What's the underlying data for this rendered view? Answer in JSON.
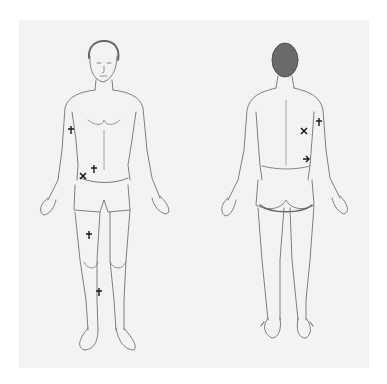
{
  "diagram": {
    "title": "",
    "type": "body-chart",
    "paper_color": "#f3f3f3",
    "line_color": "#7a7a7a",
    "mark_color": "#1a1a1a",
    "figures": [
      {
        "id": "front",
        "label": "Front view",
        "marks": [
          {
            "symbol": "plus",
            "location": "right upper arm",
            "x": 71,
            "y": 130
          },
          {
            "symbol": "plus",
            "location": "lower abdomen (right of navel)",
            "x": 94,
            "y": 169
          },
          {
            "symbol": "cross",
            "location": "right iliac / hip",
            "x": 83,
            "y": 176
          },
          {
            "symbol": "plus",
            "location": "right thigh",
            "x": 89,
            "y": 235
          },
          {
            "symbol": "plus",
            "location": "right shin",
            "x": 99,
            "y": 292
          }
        ]
      },
      {
        "id": "back",
        "label": "Back view",
        "marks": [
          {
            "symbol": "plus",
            "location": "right posterior upper arm",
            "x": 319,
            "y": 122
          },
          {
            "symbol": "cross",
            "location": "right flank / mid back",
            "x": 304,
            "y": 131
          },
          {
            "symbol": "arrow",
            "location": "right lower back (lumbar)",
            "x": 306,
            "y": 159
          }
        ]
      }
    ]
  }
}
